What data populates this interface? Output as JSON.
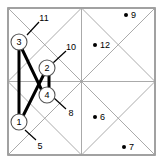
{
  "figure": {
    "background_color": "#ffffff",
    "frame_color": "#8a8a8a",
    "grid_color": "#a0a0a0",
    "edge_color": "#000000",
    "node_fill": "#ffffff",
    "node_stroke": "#555555",
    "point_color": "#000000"
  },
  "grid": {
    "left": 8,
    "top": 8,
    "right": 155,
    "bottom": 155,
    "cells_x": 2,
    "cells_y": 2,
    "diagonals": true
  },
  "nodes": [
    {
      "label": "1",
      "cx": 19,
      "cy": 122,
      "r": 8
    },
    {
      "label": "2",
      "cx": 47,
      "cy": 68,
      "r": 8
    },
    {
      "label": "3",
      "cx": 19,
      "cy": 42,
      "r": 8
    },
    {
      "label": "4",
      "cx": 47,
      "cy": 95,
      "r": 8
    }
  ],
  "edges": [
    {
      "from": "3",
      "to": "1"
    },
    {
      "from": "3",
      "to": "4"
    },
    {
      "from": "1",
      "to": "2"
    },
    {
      "from": "2",
      "to": "4"
    }
  ],
  "points": [
    {
      "label": "6",
      "cx": 95,
      "cy": 117,
      "lx": 100,
      "ly": 117
    },
    {
      "label": "7",
      "cx": 124,
      "cy": 147,
      "lx": 129,
      "ly": 147
    },
    {
      "label": "9",
      "cx": 126,
      "cy": 15,
      "lx": 131,
      "ly": 15
    },
    {
      "label": "12",
      "cx": 95,
      "cy": 45,
      "lx": 100,
      "ly": 45
    }
  ],
  "callouts": [
    {
      "label": "5",
      "tx": 40,
      "ty": 146,
      "x1": 36,
      "ty1": 140,
      "x2": 25,
      "y2": 130
    },
    {
      "label": "8",
      "tx": 71,
      "ty": 113,
      "x1": 66,
      "ty1": 109,
      "x2": 54,
      "y2": 98
    },
    {
      "label": "10",
      "tx": 71,
      "ty": 47,
      "x1": 66,
      "ty1": 51,
      "x2": 53,
      "y2": 63
    },
    {
      "label": "11",
      "tx": 44,
      "ty": 18,
      "x1": 39,
      "ty1": 22,
      "x2": 27,
      "y2": 35
    }
  ]
}
